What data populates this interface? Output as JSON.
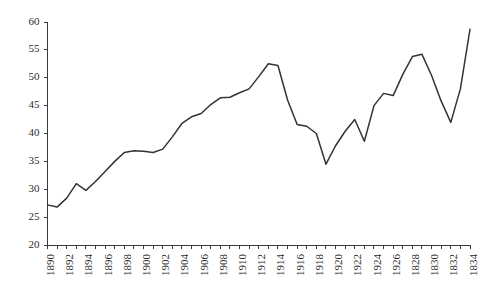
{
  "chart_data": {
    "type": "line",
    "title": "",
    "subtitle": "",
    "xlabel": "",
    "ylabel": "",
    "xlim": [
      1890,
      1934
    ],
    "ylim": [
      20,
      60
    ],
    "grid": false,
    "legend": "none",
    "y_ticks": [
      20,
      25,
      30,
      35,
      40,
      45,
      50,
      55,
      60
    ],
    "y_tick_labels": [
      "20",
      "25",
      "30",
      "35",
      "40",
      "45",
      "50",
      "55",
      "60"
    ],
    "x_tick_years": [
      1890,
      1891,
      1892,
      1893,
      1894,
      1895,
      1896,
      1897,
      1898,
      1899,
      1900,
      1901,
      1902,
      1903,
      1904,
      1905,
      1906,
      1907,
      1908,
      1909,
      1910,
      1911,
      1912,
      1913,
      1914,
      1915,
      1916,
      1917,
      1918,
      1919,
      1920,
      1921,
      1922,
      1923,
      1924,
      1925,
      1926,
      1927,
      1928,
      1929,
      1930,
      1931,
      1932,
      1933,
      1934
    ],
    "x_labeled_years": [
      1890,
      1892,
      1894,
      1896,
      1898,
      1900,
      1902,
      1904,
      1906,
      1908,
      1910,
      1912,
      1914,
      1916,
      1918,
      1920,
      1922,
      1924,
      1926,
      1928,
      1930,
      1932,
      1934
    ],
    "x_tick_labels": [
      "1890",
      "1892",
      "1894",
      "1896",
      "1898",
      "1900",
      "1902",
      "1904",
      "1906",
      "1908",
      "1910",
      "1912",
      "1914",
      "1916",
      "1918",
      "1920",
      "1922",
      "1924",
      "1926",
      "1828",
      "1830",
      "1832",
      "1834"
    ],
    "x": [
      1890,
      1891,
      1892,
      1893,
      1894,
      1895,
      1896,
      1897,
      1898,
      1899,
      1900,
      1901,
      1902,
      1903,
      1904,
      1905,
      1906,
      1907,
      1908,
      1909,
      1910,
      1911,
      1912,
      1913,
      1914,
      1915,
      1916,
      1917,
      1918,
      1919,
      1920,
      1921,
      1922,
      1923,
      1924,
      1925,
      1926,
      1927,
      1928,
      1929,
      1930,
      1931,
      1932,
      1933,
      1934
    ],
    "values": [
      27.2,
      26.8,
      28.4,
      31.0,
      29.8,
      31.4,
      33.2,
      35.0,
      36.6,
      36.9,
      36.8,
      36.6,
      37.2,
      39.4,
      41.8,
      43.0,
      43.6,
      45.2,
      46.4,
      46.5,
      47.3,
      48.0,
      50.2,
      52.5,
      52.2,
      46.0,
      41.6,
      41.3,
      40.0,
      34.5,
      37.8,
      40.4,
      42.5,
      38.6,
      45.0,
      47.2,
      46.8,
      50.6,
      53.8,
      54.2,
      50.4,
      45.8,
      42.0,
      48.0,
      58.7
    ],
    "colors": {
      "line": "#333333",
      "axis": "#3a3a3a",
      "text": "#2b2b2b",
      "background": "#ffffff"
    }
  }
}
